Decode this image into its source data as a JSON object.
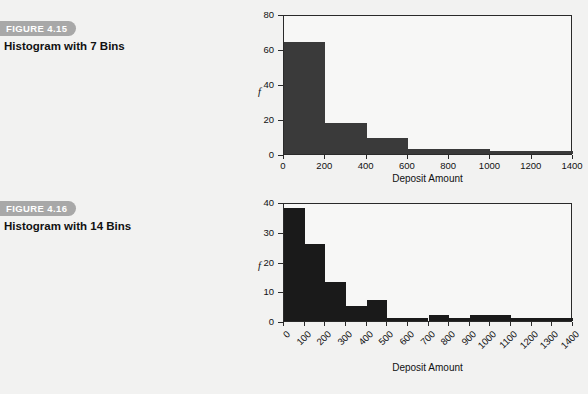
{
  "page": {
    "background_color": "#f2f2f1",
    "ink_color": "#1a1a1a",
    "tag_color": "#a8a8a8"
  },
  "figures": [
    {
      "tag": "FIGURE 4.15",
      "title": "Histogram with 7 Bins"
    },
    {
      "tag": "FIGURE 4.16",
      "title": "Histogram with 14 Bins"
    }
  ],
  "chart_data": [
    {
      "type": "bar",
      "title": "Histogram with 7 Bins",
      "xlabel": "Deposit Amount",
      "ylabel": "f",
      "bin_width": 200,
      "categories": [
        "0-200",
        "200-400",
        "400-600",
        "600-800",
        "800-1000",
        "1000-1200",
        "1200-1400"
      ],
      "bin_edges": [
        0,
        200,
        400,
        600,
        800,
        1000,
        1200,
        1400
      ],
      "values": [
        64,
        18,
        9,
        3,
        3,
        2,
        2
      ],
      "xlim": [
        0,
        1400
      ],
      "ylim": [
        0,
        80
      ],
      "xticks": [
        0,
        200,
        400,
        600,
        800,
        1000,
        1200,
        1400
      ],
      "xtick_labels": [
        "0",
        "200",
        "400",
        "600",
        "800",
        "1000",
        "1200",
        "1400"
      ],
      "yticks": [
        0,
        20,
        40,
        60,
        80
      ],
      "ytick_labels": [
        "0",
        "20",
        "40",
        "60",
        "80"
      ],
      "grid": false,
      "legend": false,
      "bar_color": "#3a3a3a"
    },
    {
      "type": "bar",
      "title": "Histogram with 14 Bins",
      "xlabel": "Deposit Amount",
      "ylabel": "f",
      "bin_width": 100,
      "categories": [
        "0-100",
        "100-200",
        "200-300",
        "300-400",
        "400-500",
        "500-600",
        "600-700",
        "700-800",
        "800-900",
        "900-1000",
        "1000-1100",
        "1100-1200",
        "1200-1300",
        "1300-1400"
      ],
      "bin_edges": [
        0,
        100,
        200,
        300,
        400,
        500,
        600,
        700,
        800,
        900,
        1000,
        1100,
        1200,
        1300,
        1400
      ],
      "values": [
        38,
        26,
        13,
        5,
        7,
        1,
        1,
        2,
        1,
        2,
        2,
        1,
        1,
        1
      ],
      "xlim": [
        0,
        1400
      ],
      "ylim": [
        0,
        40
      ],
      "xticks": [
        0,
        100,
        200,
        300,
        400,
        500,
        600,
        700,
        800,
        900,
        1000,
        1100,
        1200,
        1300,
        1400
      ],
      "xtick_labels": [
        "0",
        "100",
        "200",
        "300",
        "400",
        "500",
        "600",
        "700",
        "800",
        "900",
        "1000",
        "1100",
        "1200",
        "1300",
        "1400"
      ],
      "yticks": [
        0,
        10,
        20,
        30,
        40
      ],
      "ytick_labels": [
        "0",
        "10",
        "20",
        "30",
        "40"
      ],
      "grid": false,
      "legend": false,
      "bar_color": "#1a1a1a"
    }
  ]
}
